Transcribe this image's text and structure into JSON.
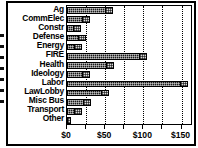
{
  "chart_data": {
    "type": "bar",
    "orientation": "horizontal",
    "title": "",
    "xlabel": "",
    "ylabel": "",
    "categories": [
      "Ag",
      "CommElec",
      "Constr",
      "Defense",
      "Energy",
      "FIRE",
      "Health",
      "Ideology",
      "Labor",
      "LawLobby",
      "Misc Bus",
      "Transport",
      "Other"
    ],
    "values": [
      60,
      30,
      18,
      25,
      20,
      105,
      62,
      30,
      158,
      55,
      32,
      20,
      3
    ],
    "xlim": [
      0,
      165
    ],
    "xticks": [
      0,
      50,
      100,
      150
    ],
    "xticklabels": [
      "$0",
      "$50",
      "$100",
      "$150"
    ],
    "gridline_values": [
      0,
      25,
      50,
      75,
      100,
      125,
      150
    ],
    "grid": true,
    "legend": "none",
    "bar_color": "#1a1a1a",
    "bar_tip_color": "#d9d9d9"
  },
  "axis": {
    "tick_labels": [
      "$0",
      "$50",
      "$100",
      "$150"
    ]
  }
}
